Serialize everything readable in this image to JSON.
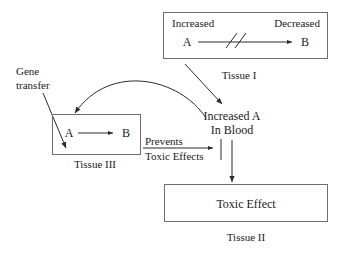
{
  "diagram": {
    "colors": {
      "box_stroke": "#6e6e6e",
      "arrow": "#2a2a2a",
      "text": "#1a1a1a",
      "background": "#ffffff"
    },
    "tissue_one": {
      "increased_label": "Increased",
      "species_a": "A",
      "decreased_label": "Decreased",
      "species_b": "B",
      "blocked_marker": "//",
      "tissue_caption": "Tissue I"
    },
    "tissue_three": {
      "species_a": "A",
      "species_b": "B",
      "tissue_caption": "Tissue III"
    },
    "tissue_two": {
      "effect_label": "Toxic Effect",
      "tissue_caption": "Tissue II"
    },
    "blood_node": {
      "line_one": "Increased A",
      "line_two": "In Blood"
    },
    "gene_transfer": {
      "line_one": "Gene",
      "line_two": "transfer"
    },
    "prevents_edge": {
      "line_one": "Prevents",
      "line_two": "Toxic Effects"
    }
  }
}
